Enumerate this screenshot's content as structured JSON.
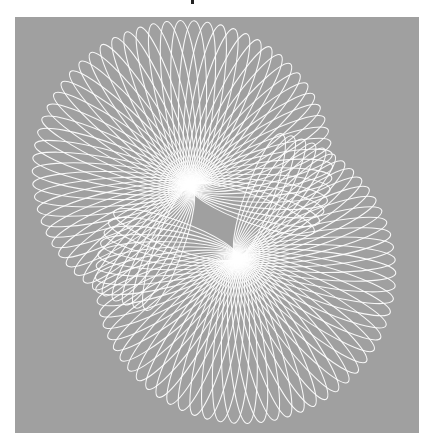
{
  "image": {
    "description": "Spirograph pattern of white looping curves on a gray square background",
    "background_color": "#ffffff",
    "panel_color": "#a0a0a0",
    "line_color": "#ffffff"
  },
  "figure": {
    "families": [
      {
        "name": "upper-left-rosette",
        "pivot": [
          176,
          170
        ],
        "radius": 168,
        "width": 14,
        "start_deg": 110,
        "end_deg": 380,
        "count": 58
      },
      {
        "name": "lower-right-rosette",
        "pivot": [
          222,
          240
        ],
        "radius": 168,
        "width": 14,
        "start_deg": -70,
        "end_deg": 200,
        "count": 58
      }
    ]
  }
}
